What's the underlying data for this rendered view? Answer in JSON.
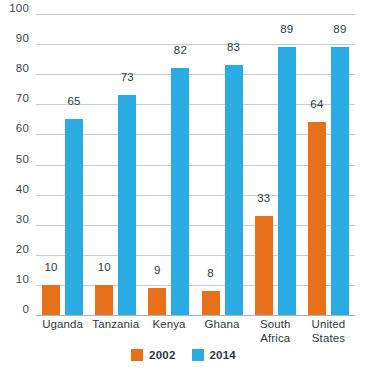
{
  "chart_data": {
    "type": "bar",
    "title": "",
    "subtitle": "",
    "xlabel": "",
    "ylabel": "",
    "ylim": [
      0,
      100
    ],
    "yticks": [
      0,
      10,
      20,
      30,
      40,
      50,
      60,
      70,
      80,
      90,
      100
    ],
    "grid": true,
    "legend_position": "bottom-center",
    "categories": [
      "Uganda",
      "Tanzania",
      "Kenya",
      "Ghana",
      "South Africa",
      "United States"
    ],
    "category_lines": [
      [
        "Uganda"
      ],
      [
        "Tanzania"
      ],
      [
        "Kenya"
      ],
      [
        "Ghana"
      ],
      [
        "South",
        "Africa"
      ],
      [
        "United",
        "States"
      ]
    ],
    "series": [
      {
        "name": "2002",
        "color": "#e8701a",
        "values": [
          10,
          10,
          9,
          8,
          33,
          64
        ]
      },
      {
        "name": "2014",
        "color": "#2aabe2",
        "values": [
          65,
          73,
          82,
          83,
          89,
          89
        ]
      }
    ]
  },
  "colors": {
    "series_2002": "#e8701a",
    "series_2014": "#2aabe2",
    "gridline": "#c3cdd6",
    "baseline": "#a9b4bd",
    "text": "#2f3840",
    "background": "#ffffff"
  },
  "legend": {
    "items": [
      {
        "label": "2002",
        "color": "#e8701a"
      },
      {
        "label": "2014",
        "color": "#2aabe2"
      }
    ]
  }
}
